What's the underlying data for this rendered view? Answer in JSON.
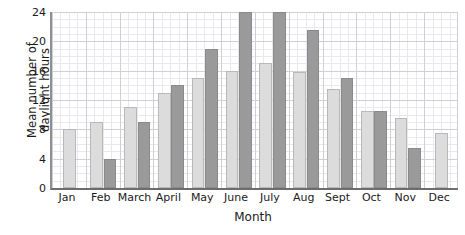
{
  "chart_data": {
    "type": "bar",
    "title": "",
    "xlabel": "Month",
    "ylabel": "Mean number of daylight hours",
    "ylabel_lines": [
      "Mean number of",
      "daylight hours"
    ],
    "categories": [
      "Jan",
      "Feb",
      "March",
      "April",
      "May",
      "June",
      "July",
      "Aug",
      "Sept",
      "Oct",
      "Nov",
      "Dec"
    ],
    "series": [
      {
        "name": "light-series",
        "color": "#dcdcdc",
        "values": [
          8,
          9,
          11,
          13,
          15,
          16,
          17,
          15.8,
          13.5,
          10.5,
          9.5,
          7.5
        ]
      },
      {
        "name": "dark-series",
        "color": "#9a9a9a",
        "values": [
          null,
          4,
          9,
          14,
          19,
          24,
          24,
          21.5,
          15,
          10.5,
          5.5,
          null
        ]
      }
    ],
    "ylim": [
      0,
      24
    ],
    "yticks": [
      0,
      4,
      8,
      12,
      16,
      20,
      24
    ],
    "ytick_labels": [
      "0",
      "4",
      "8",
      "12",
      "16",
      "20",
      "24"
    ],
    "grid": true,
    "grid_minor": true,
    "legend": "none"
  }
}
